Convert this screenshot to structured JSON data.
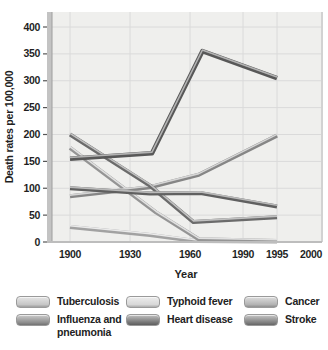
{
  "figure": {
    "ylabel": "Death rates per 100,000",
    "xlabel": "Year"
  },
  "chart_data": {
    "type": "line",
    "title": "",
    "xlabel": "Year",
    "ylabel": "Death rates per 100,000",
    "x_tick_labels": [
      "1900",
      "1930",
      "1960",
      "1990",
      "1995",
      "2000"
    ],
    "y_ticks": [
      0,
      50,
      100,
      150,
      200,
      250,
      300,
      350,
      400
    ],
    "ylim": [
      0,
      400
    ],
    "grid": true,
    "legend_position": "bottom",
    "series": [
      {
        "name": "Typhoid fever",
        "color": "#d8d8d8",
        "points": [
          [
            1900,
            28
          ],
          [
            1940,
            13
          ],
          [
            1963,
            2
          ],
          [
            1995,
            1
          ]
        ]
      },
      {
        "name": "Tuberculosis",
        "color": "#c6c6c6",
        "points": [
          [
            1900,
            175
          ],
          [
            1943,
            55
          ],
          [
            1965,
            5
          ],
          [
            1995,
            2
          ]
        ]
      },
      {
        "name": "Cancer",
        "color": "#b3b3b3",
        "points": [
          [
            1900,
            85
          ],
          [
            1940,
            102
          ],
          [
            1965,
            125
          ],
          [
            1995,
            198
          ]
        ]
      },
      {
        "name": "Influenza and pneumonia",
        "color": "#8e8e8e",
        "points": [
          [
            1900,
            200
          ],
          [
            1940,
            105
          ],
          [
            1962,
            37
          ],
          [
            1995,
            46
          ]
        ]
      },
      {
        "name": "Stroke",
        "color": "#808080",
        "points": [
          [
            1900,
            100
          ],
          [
            1940,
            90
          ],
          [
            1966,
            91
          ],
          [
            1995,
            66
          ]
        ]
      },
      {
        "name": "Heart disease",
        "color": "#757575",
        "points": [
          [
            1900,
            155
          ],
          [
            1941,
            165
          ],
          [
            1967,
            355
          ],
          [
            1995,
            305
          ]
        ]
      }
    ]
  },
  "legend": {
    "columns": [
      [
        "Tuberculosis",
        "Influenza and pneumonia"
      ],
      [
        "Typhoid fever",
        "Heart disease"
      ],
      [
        "Cancer",
        "Stroke"
      ]
    ]
  }
}
